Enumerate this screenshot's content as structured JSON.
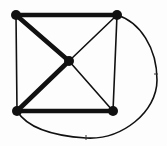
{
  "canvas": {
    "width": 167,
    "height": 146,
    "background": "#fdfdfd"
  },
  "diagram": {
    "type": "graph",
    "ink_color": "#111111",
    "vertex_color": "#111111",
    "vertex_radius": 5,
    "thick_stroke_width": 4.6,
    "thin_stroke_width": 1.6,
    "tick_color": "#333333",
    "vertices": [
      {
        "id": "top-left",
        "x": 16,
        "y": 15
      },
      {
        "id": "top-right",
        "x": 117,
        "y": 15
      },
      {
        "id": "bottom-left",
        "x": 17,
        "y": 111
      },
      {
        "id": "bottom-right",
        "x": 113,
        "y": 111
      },
      {
        "id": "center",
        "x": 69,
        "y": 61
      }
    ],
    "edges": [
      {
        "from": "top-left",
        "to": "top-right",
        "weight": "thick",
        "shape": "line"
      },
      {
        "from": "bottom-left",
        "to": "bottom-right",
        "weight": "thick",
        "shape": "line"
      },
      {
        "from": "top-left",
        "to": "center",
        "weight": "thick",
        "shape": "line"
      },
      {
        "from": "center",
        "to": "bottom-left",
        "weight": "thick",
        "shape": "line"
      },
      {
        "from": "top-left",
        "to": "bottom-left",
        "weight": "thin",
        "shape": "line"
      },
      {
        "from": "top-right",
        "to": "bottom-right",
        "weight": "thin",
        "shape": "line"
      },
      {
        "from": "top-right",
        "to": "center",
        "weight": "thin",
        "shape": "line"
      },
      {
        "from": "center",
        "to": "bottom-right",
        "weight": "thin",
        "shape": "line"
      },
      {
        "from": "top-right",
        "to": "bottom-left",
        "weight": "thin",
        "shape": "curve",
        "path": "M 117 15 C 140 22 157 48 157 80 C 157 112 122 140 86 138 C 55 136 28 129 17 111"
      }
    ],
    "marks": [
      {
        "id": "curve-tick-right",
        "x1": 154,
        "y1": 74,
        "x2": 158,
        "y2": 74
      },
      {
        "id": "curve-tick-bottom",
        "x1": 86,
        "y1": 135,
        "x2": 86,
        "y2": 140
      }
    ]
  }
}
